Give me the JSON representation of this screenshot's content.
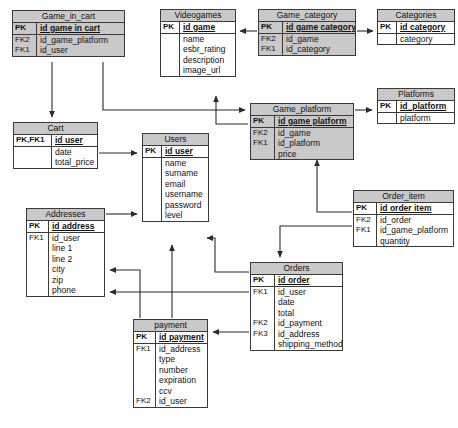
{
  "diagram": {
    "type": "entity-relationship-diagram",
    "title": "",
    "colors": {
      "header_fill": "#c9c9c9",
      "body_fill": "#ffffff",
      "border": "#3a3a3a",
      "connector": "#2b2b2b"
    },
    "entities": [
      {
        "id": "game_in_cart",
        "name": "Game_in_cart",
        "shaded": true,
        "x": 12,
        "y": 10,
        "w": 113,
        "keycol_w": 24,
        "primary_keys": [
          {
            "key": "PK",
            "field": "id game in cart"
          }
        ],
        "attributes": [
          {
            "key": "FK2",
            "field": "id_game_platform"
          },
          {
            "key": "FK1",
            "field": "id_user"
          }
        ]
      },
      {
        "id": "videogames",
        "name": "Videogames",
        "shaded": false,
        "x": 160,
        "y": 9,
        "w": 76,
        "keycol_w": 19,
        "primary_keys": [
          {
            "key": "PK",
            "field": "id game"
          }
        ],
        "attributes": [
          {
            "key": "",
            "field": "name"
          },
          {
            "key": "",
            "field": "esbr_rating"
          },
          {
            "key": "",
            "field": "description"
          },
          {
            "key": "",
            "field": "image_url"
          }
        ]
      },
      {
        "id": "game_category",
        "name": "Game_category",
        "shaded": true,
        "x": 258,
        "y": 9,
        "w": 98,
        "keycol_w": 24,
        "primary_keys": [
          {
            "key": "PK",
            "field": "id game category"
          }
        ],
        "attributes": [
          {
            "key": "FK2",
            "field": "id_game"
          },
          {
            "key": "FK1",
            "field": "id_category"
          }
        ]
      },
      {
        "id": "categories",
        "name": "Categories",
        "shaded": false,
        "x": 377,
        "y": 9,
        "w": 78,
        "keycol_w": 19,
        "primary_keys": [
          {
            "key": "PK",
            "field": "id category"
          }
        ],
        "attributes": [
          {
            "key": "",
            "field": "category"
          }
        ]
      },
      {
        "id": "game_platform",
        "name": "Game_platform",
        "shaded": true,
        "x": 250,
        "y": 103,
        "w": 104,
        "keycol_w": 24,
        "primary_keys": [
          {
            "key": "PK",
            "field": "id game platform"
          }
        ],
        "attributes": [
          {
            "key": "FK2",
            "field": "id_game"
          },
          {
            "key": "FK1",
            "field": "id_platform"
          },
          {
            "key": "",
            "field": "price"
          }
        ]
      },
      {
        "id": "platforms",
        "name": "Platforms",
        "shaded": false,
        "x": 377,
        "y": 88,
        "w": 78,
        "keycol_w": 19,
        "primary_keys": [
          {
            "key": "PK",
            "field": "id_platform"
          }
        ],
        "attributes": [
          {
            "key": "",
            "field": "platform"
          }
        ]
      },
      {
        "id": "cart",
        "name": "Cart",
        "shaded": false,
        "x": 13,
        "y": 122,
        "w": 85,
        "keycol_w": 38,
        "primary_keys": [
          {
            "key": "PK,FK1",
            "field": "id user"
          }
        ],
        "attributes": [
          {
            "key": "",
            "field": "date"
          },
          {
            "key": "",
            "field": "total_price"
          }
        ]
      },
      {
        "id": "users",
        "name": "Users",
        "shaded": false,
        "x": 142,
        "y": 133,
        "w": 67,
        "keycol_w": 19,
        "primary_keys": [
          {
            "key": "PK",
            "field": "id user"
          }
        ],
        "attributes": [
          {
            "key": "",
            "field": "name"
          },
          {
            "key": "",
            "field": "surname"
          },
          {
            "key": "",
            "field": "email"
          },
          {
            "key": "",
            "field": "username"
          },
          {
            "key": "",
            "field": "password"
          },
          {
            "key": "",
            "field": "level"
          }
        ]
      },
      {
        "id": "order_item",
        "name": "Order_item",
        "shaded": false,
        "x": 353,
        "y": 190,
        "w": 101,
        "keycol_w": 23,
        "primary_keys": [
          {
            "key": "PK",
            "field": "id order item"
          }
        ],
        "attributes": [
          {
            "key": "FK2",
            "field": "id_order"
          },
          {
            "key": "FK1",
            "field": "id_game_platform"
          },
          {
            "key": "",
            "field": "quantity"
          }
        ]
      },
      {
        "id": "addresses",
        "name": "Addresses",
        "shaded": false,
        "x": 26,
        "y": 208,
        "w": 79,
        "keycol_w": 22,
        "primary_keys": [
          {
            "key": "PK",
            "field": "id address"
          }
        ],
        "attributes": [
          {
            "key": "FK1",
            "field": "id_user"
          },
          {
            "key": "",
            "field": "line 1"
          },
          {
            "key": "",
            "field": "line 2"
          },
          {
            "key": "",
            "field": "city"
          },
          {
            "key": "",
            "field": "zip"
          },
          {
            "key": "",
            "field": "phone"
          }
        ]
      },
      {
        "id": "orders",
        "name": "Orders",
        "shaded": false,
        "x": 250,
        "y": 262,
        "w": 93,
        "keycol_w": 24,
        "primary_keys": [
          {
            "key": "PK",
            "field": "id order"
          }
        ],
        "attributes": [
          {
            "key": "FK1",
            "field": "id_user"
          },
          {
            "key": "",
            "field": "date"
          },
          {
            "key": "",
            "field": "total"
          },
          {
            "key": "FK2",
            "field": "id_payment"
          },
          {
            "key": "FK3",
            "field": "id_address"
          },
          {
            "key": "",
            "field": "shipping_method"
          }
        ]
      },
      {
        "id": "payment",
        "name": "payment",
        "shaded": false,
        "x": 133,
        "y": 319,
        "w": 75,
        "keycol_w": 22,
        "primary_keys": [
          {
            "key": "PK",
            "field": "id payment"
          }
        ],
        "attributes": [
          {
            "key": "FK1",
            "field": "id_address"
          },
          {
            "key": "",
            "field": "type"
          },
          {
            "key": "",
            "field": "number"
          },
          {
            "key": "",
            "field": "expiration"
          },
          {
            "key": "",
            "field": "ccv"
          },
          {
            "key": "FK2",
            "field": "id_user"
          }
        ]
      }
    ],
    "relationships": [
      {
        "from": "game_category",
        "to": "videogames",
        "label": ""
      },
      {
        "from": "game_category",
        "to": "categories",
        "label": ""
      },
      {
        "from": "game_platform",
        "to": "videogames",
        "label": ""
      },
      {
        "from": "game_platform",
        "to": "platforms",
        "label": ""
      },
      {
        "from": "game_in_cart",
        "to": "cart",
        "label": ""
      },
      {
        "from": "game_in_cart",
        "to": "game_platform",
        "label": ""
      },
      {
        "from": "cart",
        "to": "users",
        "label": ""
      },
      {
        "from": "order_item",
        "to": "game_platform",
        "label": ""
      },
      {
        "from": "order_item",
        "to": "orders",
        "label": ""
      },
      {
        "from": "addresses",
        "to": "users",
        "label": ""
      },
      {
        "from": "payment",
        "to": "users",
        "label": ""
      },
      {
        "from": "payment",
        "to": "addresses",
        "label": ""
      },
      {
        "from": "orders",
        "to": "users",
        "label": ""
      },
      {
        "from": "orders",
        "to": "addresses",
        "label": ""
      },
      {
        "from": "orders",
        "to": "payment",
        "label": ""
      }
    ]
  }
}
